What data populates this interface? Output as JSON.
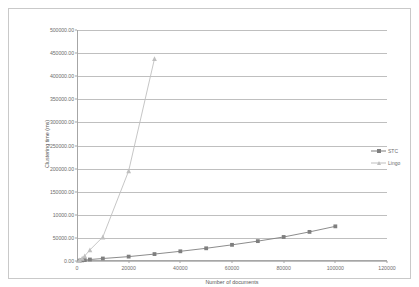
{
  "chart_data": {
    "type": "line",
    "title": "",
    "xlabel": "Number of documents",
    "ylabel": "Clustering time (ms)",
    "xlim": [
      0,
      120000
    ],
    "ylim": [
      0,
      500000
    ],
    "grid": true,
    "legend_position": "right",
    "x_tick_labels": [
      "0",
      "20000",
      "40000",
      "60000",
      "80000",
      "100000",
      "120000"
    ],
    "x_tick_values": [
      0,
      20000,
      40000,
      60000,
      80000,
      100000,
      120000
    ],
    "y_tick_labels": [
      "0.00",
      "50000.00",
      "10000.00",
      "150000.00",
      "200000.00",
      "250000.00",
      "300000.00",
      "350000.00",
      "400000.00",
      "450000.00",
      "500000.00"
    ],
    "y_tick_values": [
      0,
      50000,
      100000,
      150000,
      200000,
      250000,
      300000,
      350000,
      400000,
      450000,
      500000
    ],
    "series": [
      {
        "name": "STC",
        "color": "#7f7f7f",
        "marker": "square",
        "x": [
          1000,
          2000,
          3000,
          5000,
          10000,
          20000,
          30000,
          40000,
          50000,
          60000,
          70000,
          80000,
          90000,
          100000
        ],
        "values": [
          900,
          1400,
          2000,
          3200,
          5400,
          9500,
          15000,
          21000,
          27500,
          35000,
          43000,
          52000,
          63000,
          75000
        ]
      },
      {
        "name": "Lingo",
        "color": "#bfbfbf",
        "marker": "triangle",
        "x": [
          1000,
          2000,
          3000,
          5000,
          10000,
          20000,
          30000
        ],
        "values": [
          2500,
          6000,
          11000,
          24000,
          52000,
          195000,
          438000
        ]
      }
    ]
  },
  "legend": {
    "entries": [
      {
        "label": "STC"
      },
      {
        "label": "Lingo"
      }
    ]
  },
  "axes": {
    "y_title": "Clustering time (ms)",
    "x_title": "Number of documents"
  }
}
